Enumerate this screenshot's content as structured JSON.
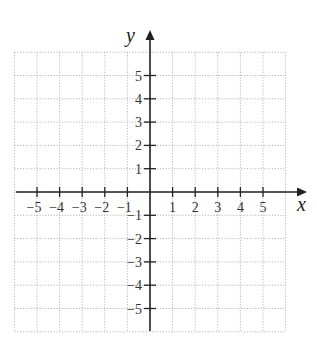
{
  "chart_data": {
    "type": "scatter",
    "title": "",
    "xlabel": "x",
    "ylabel": "y",
    "xlim": [
      -6,
      6
    ],
    "ylim": [
      -6,
      6
    ],
    "grid": true,
    "grid_style": "dotted",
    "x_ticks": [
      -5,
      -4,
      -3,
      -2,
      -1,
      1,
      2,
      3,
      4,
      5
    ],
    "y_ticks": [
      -5,
      -4,
      -3,
      -2,
      -1,
      1,
      2,
      3,
      4,
      5
    ],
    "x_tick_labels": [
      "−5",
      "−4",
      "−3",
      "−2",
      "−1",
      "1",
      "2",
      "3",
      "4",
      "5"
    ],
    "y_tick_labels": [
      "−5",
      "−4",
      "−3",
      "−2",
      "−1",
      "1",
      "2",
      "3",
      "4",
      "5"
    ],
    "series": []
  },
  "axes": {
    "x_label": "x",
    "y_label": "y"
  },
  "colors": {
    "axis": "#222222",
    "grid": "#b8b8b8",
    "text": "#333333"
  }
}
